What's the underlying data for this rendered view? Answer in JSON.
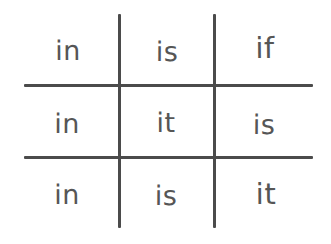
{
  "canvas": {
    "width": 331,
    "height": 244,
    "background_color": "#ffffff",
    "line_color": "#4b4b4b",
    "text_color": "#565656"
  },
  "grid": {
    "rows": 3,
    "columns": 3,
    "vertical_line_count": 2,
    "horizontal_line_count": 2
  },
  "cells": [
    {
      "id": "r1c1",
      "row": 1,
      "column": 1,
      "text": "in"
    },
    {
      "id": "r1c2",
      "row": 1,
      "column": 2,
      "text": "is"
    },
    {
      "id": "r1c3",
      "row": 1,
      "column": 3,
      "text": "if"
    },
    {
      "id": "r2c1",
      "row": 2,
      "column": 1,
      "text": "in"
    },
    {
      "id": "r2c2",
      "row": 2,
      "column": 2,
      "text": "it"
    },
    {
      "id": "r2c3",
      "row": 2,
      "column": 3,
      "text": "is"
    },
    {
      "id": "r3c1",
      "row": 3,
      "column": 1,
      "text": "in"
    },
    {
      "id": "r3c2",
      "row": 3,
      "column": 2,
      "text": "is"
    },
    {
      "id": "r3c3",
      "row": 3,
      "column": 3,
      "text": "it"
    }
  ]
}
